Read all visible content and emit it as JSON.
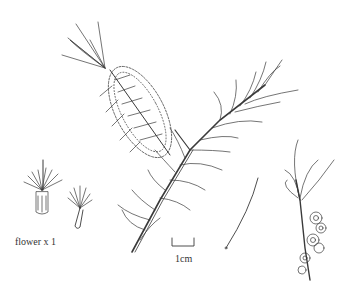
{
  "illustration": {
    "subject": "bottlebrush branch with flower spike",
    "labels": {
      "flower_caption": "flower x 1",
      "scale_caption": "1cm"
    },
    "colors": {
      "background": "#ffffff",
      "ink": "#3a3a3a"
    }
  }
}
